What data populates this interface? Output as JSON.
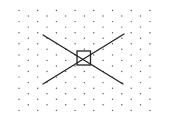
{
  "diagram": {
    "background": "#ffffff",
    "dot_grid": {
      "type": "staggered",
      "dot_color": "#555555",
      "dot_radius": 0.7,
      "primary_rows": {
        "x": [
          19,
          37.7,
          56.4,
          75.1,
          93.8,
          112.5,
          131.2,
          149.9
        ],
        "y": [
          10.5,
          21.6,
          32.7,
          43.8,
          54.9,
          66,
          77.1,
          88.2,
          99.3,
          110.4
        ]
      },
      "offset_rows": {
        "x": [
          28.3,
          47,
          65.7,
          84.4,
          103.1,
          121.8,
          140.5
        ],
        "y": [
          16,
          27.1,
          38.2,
          49.3,
          60.4,
          71.5,
          82.6,
          93.7,
          104.8
        ]
      }
    },
    "shapes": {
      "stroke_color": "#222222",
      "stroke_width": 1.3,
      "lines": [
        {
          "name": "diagonal-line-descending",
          "x1": 43,
          "y1": 35,
          "x2": 123,
          "y2": 84
        },
        {
          "name": "diagonal-line-ascending",
          "x1": 43,
          "y1": 84,
          "x2": 124,
          "y2": 34
        }
      ],
      "square": {
        "x": 77,
        "y": 51,
        "width": 13.5,
        "height": 14
      }
    }
  }
}
